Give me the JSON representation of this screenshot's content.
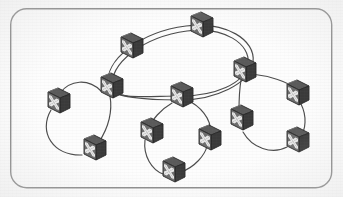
{
  "diagram": {
    "kind": "network-topology",
    "canvas": {
      "width": 343,
      "height": 197
    },
    "colors": {
      "background": "#fdfdfd",
      "frame_stroke": "#8a8a8a",
      "link_stroke": "#4b4b4b",
      "node_body_dark": "#3f3f3f",
      "node_body_mid": "#5a5a5a",
      "node_face": "#6e6e6e",
      "node_glyph": "#e8e8e8",
      "node_outline": "#2b2b2b"
    },
    "frame": {
      "x": 10,
      "y": 8,
      "width": 322,
      "height": 180,
      "corner_radius": 16,
      "stroke_width": 1.4
    },
    "node_icon": {
      "semantic": "network-switch-icon",
      "shape": "isometric-cube",
      "glyph": "four-point-outward-arrows",
      "width": 26,
      "height": 26
    },
    "nodes": [
      {
        "id": "n1",
        "label": "switch-top-center",
        "x": 200,
        "y": 27,
        "group": "core-ring"
      },
      {
        "id": "n2",
        "label": "switch-upper-left",
        "x": 130,
        "y": 48,
        "group": "core-ring"
      },
      {
        "id": "n3",
        "label": "switch-left-hub",
        "x": 110,
        "y": 88,
        "group": "core-ring"
      },
      {
        "id": "n4",
        "label": "switch-center-hub",
        "x": 180,
        "y": 97,
        "group": "core-ring"
      },
      {
        "id": "n5",
        "label": "switch-right-hub",
        "x": 243,
        "y": 72,
        "group": "core-ring"
      },
      {
        "id": "n6",
        "label": "switch-far-left",
        "x": 57,
        "y": 103,
        "group": "left-ring"
      },
      {
        "id": "n7",
        "label": "switch-left-lower",
        "x": 93,
        "y": 150,
        "group": "left-ring"
      },
      {
        "id": "n8",
        "label": "switch-center-left",
        "x": 150,
        "y": 133,
        "group": "center-ring"
      },
      {
        "id": "n9",
        "label": "switch-center-right",
        "x": 208,
        "y": 140,
        "group": "center-ring"
      },
      {
        "id": "n10",
        "label": "switch-bottom",
        "x": 172,
        "y": 172,
        "group": "center-ring"
      },
      {
        "id": "n11",
        "label": "switch-right-lower",
        "x": 240,
        "y": 120,
        "group": "right-ring"
      },
      {
        "id": "n12",
        "label": "switch-far-right-up",
        "x": 296,
        "y": 95,
        "group": "right-ring"
      },
      {
        "id": "n13",
        "label": "switch-far-right-dn",
        "x": 296,
        "y": 142,
        "group": "right-ring"
      }
    ],
    "links": [
      {
        "from": "n2",
        "to": "n1",
        "style": "double",
        "curve": "arc-up",
        "group": "core-ring"
      },
      {
        "from": "n1",
        "to": "n5",
        "style": "double",
        "curve": "arc-up",
        "group": "core-ring"
      },
      {
        "from": "n5",
        "to": "n4",
        "style": "double",
        "curve": "arc-down",
        "group": "core-ring"
      },
      {
        "from": "n4",
        "to": "n3",
        "style": "double",
        "curve": "arc-down",
        "group": "core-ring"
      },
      {
        "from": "n3",
        "to": "n2",
        "style": "double",
        "curve": "arc-left",
        "group": "core-ring"
      },
      {
        "from": "n3",
        "to": "n6",
        "style": "single",
        "curve": "arc-up",
        "group": "left-ring"
      },
      {
        "from": "n6",
        "to": "n7",
        "style": "single",
        "curve": "arc-left",
        "group": "left-ring"
      },
      {
        "from": "n7",
        "to": "n3",
        "style": "single",
        "curve": "arc-right",
        "group": "left-ring"
      },
      {
        "from": "n4",
        "to": "n8",
        "style": "single",
        "curve": "arc-left",
        "group": "center-ring"
      },
      {
        "from": "n8",
        "to": "n10",
        "style": "single",
        "curve": "arc-left",
        "group": "center-ring"
      },
      {
        "from": "n10",
        "to": "n9",
        "style": "single",
        "curve": "arc-right",
        "group": "center-ring"
      },
      {
        "from": "n9",
        "to": "n4",
        "style": "single",
        "curve": "arc-right",
        "group": "center-ring"
      },
      {
        "from": "n5",
        "to": "n12",
        "style": "single",
        "curve": "arc-up",
        "group": "right-ring"
      },
      {
        "from": "n12",
        "to": "n13",
        "style": "single",
        "curve": "arc-right",
        "group": "right-ring"
      },
      {
        "from": "n13",
        "to": "n11",
        "style": "single",
        "curve": "arc-down",
        "group": "right-ring"
      },
      {
        "from": "n11",
        "to": "n5",
        "style": "single",
        "curve": "arc-left",
        "group": "right-ring"
      }
    ],
    "counts": {
      "nodes_total": 13,
      "links_total": 16,
      "rings_total": 4
    }
  }
}
